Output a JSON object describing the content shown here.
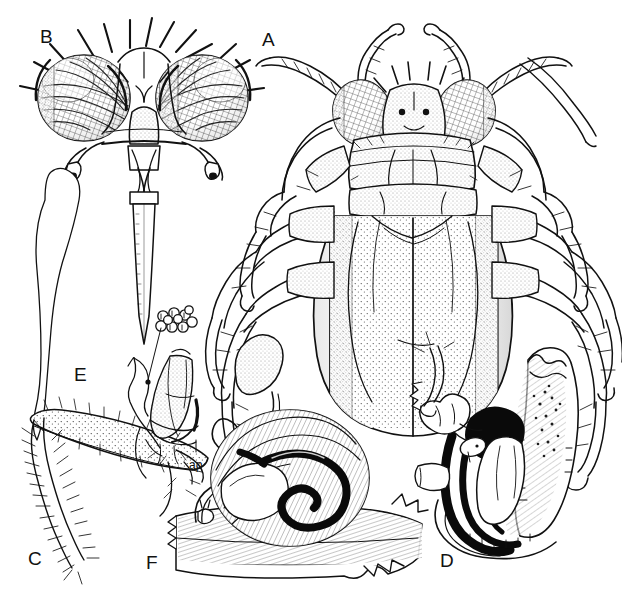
{
  "figure": {
    "kind": "scientific-illustration-plate",
    "medium": "pen-and-ink stipple line drawing",
    "background_color": "#ffffff",
    "ink_color": "#111111",
    "width_px": 622,
    "height_px": 603
  },
  "panels": [
    {
      "id": "A",
      "label": "A",
      "label_x": 262,
      "label_y": 30,
      "name": "panel-a-habitus-dorsal",
      "description": "whole insect, dorsal habitus with six legs, antennae, compound eyes, pronotum and hemelytra"
    },
    {
      "id": "B",
      "label": "B",
      "label_x": 40,
      "label_y": 27,
      "name": "panel-b-head-frontal",
      "description": "head in frontal view with two large faceted compound eyes, bristles, antennae and elongate rostrum"
    },
    {
      "id": "C",
      "label": "C",
      "label_x": 28,
      "label_y": 549,
      "name": "panel-c-leg",
      "description": "leg segment with dense setae and stippled surface"
    },
    {
      "id": "D",
      "label": "D",
      "label_x": 440,
      "label_y": 551,
      "name": "panel-d-genital-capsule",
      "description": "genital structure with solid black sclerites and pale membranous lobes"
    },
    {
      "id": "E",
      "label": "E",
      "label_x": 74,
      "label_y": 365,
      "name": "panel-e-outline",
      "description": "elongate sinuous outline of an appendage, drawn as a simple contour"
    },
    {
      "id": "F",
      "label": "F",
      "label_x": 146,
      "label_y": 553,
      "name": "panel-f-coiled-organ",
      "description": "coiled internal organ with thick black spiral duct on a hatched substrate, plus a pear-shaped vesicle on a long filament"
    }
  ],
  "annotations": [
    {
      "text": "ap",
      "x": 189,
      "y": 459,
      "name": "annotation-ap",
      "refers_to": "apodeme on the subgenital plate in the small pygophore inset"
    }
  ],
  "insets": [
    {
      "name": "pore-cluster-inset",
      "description": "cluster of ring-like pores connected by a leader line to a point on the sclerite below"
    }
  ]
}
